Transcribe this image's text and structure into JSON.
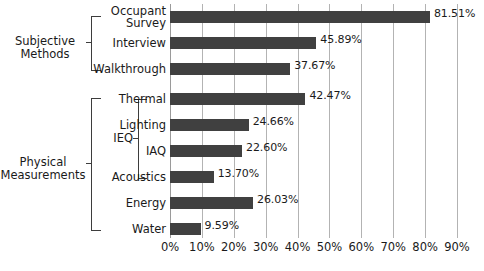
{
  "chart_data": {
    "type": "bar",
    "orientation": "horizontal",
    "title": "",
    "xlabel": "",
    "ylabel": "",
    "xlim": [
      0,
      90
    ],
    "grid": true,
    "legend": "none",
    "tick_labels": [
      "0%",
      "10%",
      "20%",
      "30%",
      "40%",
      "50%",
      "60%",
      "70%",
      "80%",
      "90%"
    ],
    "tick_values": [
      0,
      10,
      20,
      30,
      40,
      50,
      60,
      70,
      80,
      90
    ],
    "categories": [
      "Occupant\nSurvey",
      "Interview",
      "Walkthrough",
      "Thermal",
      "Lighting",
      "IAQ",
      "Acoustics",
      "Energy",
      "Water"
    ],
    "values": [
      81.51,
      45.89,
      37.67,
      42.47,
      24.66,
      22.6,
      13.7,
      26.03,
      9.59
    ],
    "value_labels": [
      "81.51%",
      "45.89%",
      "37.67%",
      "42.47%",
      "24.66%",
      "22.60%",
      "13.70%",
      "26.03%",
      "9.59%"
    ],
    "bar_color": "#404040",
    "gridline_color": "#b3b3b3",
    "groups": [
      {
        "label": "Subjective\nMethods",
        "members": [
          0,
          1,
          2
        ]
      },
      {
        "label": "Physical\nMeasurements",
        "members": [
          3,
          4,
          5,
          6,
          7,
          8
        ]
      },
      {
        "label": "IEQ",
        "members": [
          3,
          4,
          5,
          6
        ]
      }
    ]
  },
  "groups": {
    "subjective": "Subjective\nMethods",
    "physical": "Physical\nMeasurements",
    "ieq": "IEQ"
  }
}
